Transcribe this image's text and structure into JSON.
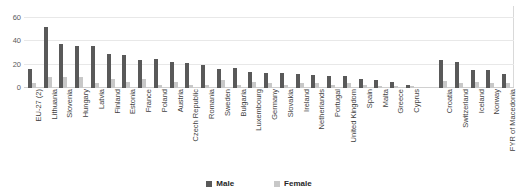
{
  "chart_data": {
    "type": "bar",
    "title": "",
    "xlabel": "",
    "ylabel": "",
    "ylim": [
      0,
      70
    ],
    "yticks": [
      0,
      20,
      40,
      60
    ],
    "grid": true,
    "legend_position": "bottom-center",
    "colors": {
      "male": "#595959",
      "female": "#c8c8c8",
      "gridline": "#e8e8e8",
      "axis_text": "#5a5a5a",
      "label_text": "#3f3f3f"
    },
    "categories": [
      "EU-27 (2)",
      "Lithuania",
      "Slovenia",
      "Hungary",
      "Latvia",
      "Finland",
      "Estonia",
      "France",
      "Poland",
      "Austria",
      "Czech Republic",
      "Romania",
      "Sweden",
      "Bulgaria",
      "Luxembourg",
      "Germany",
      "Slovakia",
      "Ireland",
      "Netherlands",
      "Portugal",
      "United Kingdom",
      "Spain",
      "Malta",
      "Greece",
      "Cyprus",
      "Croatia",
      "Switzerland",
      "Iceland",
      "Norway",
      "FYR of Macedonia"
    ],
    "group_break_after": "Cyprus",
    "series": [
      {
        "name": "Male",
        "values": [
          16,
          52,
          38,
          36,
          36,
          29,
          28,
          24,
          25,
          22,
          21,
          20,
          16,
          17,
          14,
          13,
          13,
          12,
          11,
          10,
          10,
          8,
          7,
          5,
          3,
          24,
          22,
          15,
          15,
          12
        ]
      },
      {
        "name": "Female",
        "values": [
          4,
          9,
          9,
          9,
          4,
          8,
          5,
          8,
          3,
          5,
          3,
          3,
          7,
          3,
          5,
          4,
          3,
          4,
          4,
          3,
          4,
          3,
          2,
          2,
          2,
          6,
          4,
          5,
          4,
          4
        ]
      }
    ],
    "legend": [
      {
        "key": "male",
        "label": "Male"
      },
      {
        "key": "female",
        "label": "Female"
      }
    ]
  }
}
